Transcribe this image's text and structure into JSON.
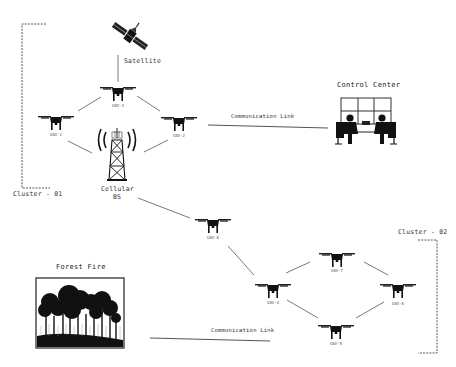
{
  "diagram": {
    "type": "network",
    "clusters": [
      {
        "id": "cluster-01",
        "label": "Cluster - 01"
      },
      {
        "id": "cluster-02",
        "label": "Cluster - 02"
      }
    ],
    "nodes": {
      "satellite": {
        "label": "Satellite",
        "icon": "satellite-icon"
      },
      "cellular": {
        "label_line1": "Cellular",
        "label_line2": "BS",
        "icon": "cell-tower-icon"
      },
      "control_center": {
        "label": "Control Center",
        "icon": "control-room-icon"
      },
      "forest_fire": {
        "label": "Forest Fire",
        "icon": "forest-image"
      },
      "uav1": {
        "label": "UAV-1",
        "icon": "drone-icon"
      },
      "uav2": {
        "label": "UAV-2",
        "icon": "drone-icon"
      },
      "uav3": {
        "label": "UAV-3",
        "icon": "drone-icon"
      },
      "uav4": {
        "label": "UAV-4",
        "icon": "drone-icon"
      },
      "uav5": {
        "label": "UAV-5",
        "icon": "drone-icon"
      },
      "uav6": {
        "label": "UAV-6",
        "icon": "drone-icon"
      },
      "uav7": {
        "label": "UAV-7",
        "icon": "drone-icon"
      },
      "uav8": {
        "label": "UAV-8",
        "icon": "drone-icon"
      }
    },
    "links": [
      {
        "from": "satellite",
        "to": "uav3"
      },
      {
        "from": "uav3",
        "to": "uav1"
      },
      {
        "from": "uav3",
        "to": "uav2"
      },
      {
        "from": "uav1",
        "to": "cellular"
      },
      {
        "from": "uav2",
        "to": "cellular"
      },
      {
        "from": "uav2",
        "to": "control_center",
        "label": "Communication Link"
      },
      {
        "from": "cellular",
        "to": "uav8"
      },
      {
        "from": "uav8",
        "to": "uav4"
      },
      {
        "from": "uav4",
        "to": "uav7"
      },
      {
        "from": "uav7",
        "to": "uav6"
      },
      {
        "from": "uav4",
        "to": "uav5"
      },
      {
        "from": "uav5",
        "to": "uav6"
      },
      {
        "from": "forest_fire",
        "to": "uav4",
        "label": "Communication Link"
      }
    ],
    "link_labels": {
      "top": "Communication Link",
      "bottom": "Communication Link"
    }
  }
}
